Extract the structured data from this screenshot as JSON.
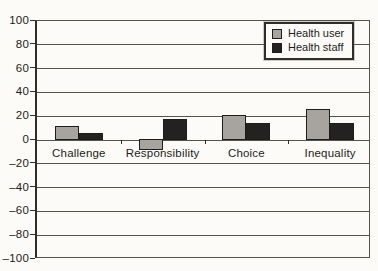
{
  "chart_data": {
    "type": "bar",
    "title": "",
    "categories": [
      "Challenge",
      "Responsibility",
      "Choice",
      "Inequality"
    ],
    "series": [
      {
        "name": "Health user",
        "color": "#a7a4a0",
        "values": [
          12,
          -8,
          21,
          26
        ]
      },
      {
        "name": "Health staff",
        "color": "#232220",
        "values": [
          6,
          18,
          14,
          14
        ]
      }
    ],
    "xlabel": "",
    "ylabel": "",
    "ylim": [
      -100,
      100
    ],
    "ytick_step": 20,
    "ytick_labels": [
      "100",
      "80",
      "60",
      "40",
      "20",
      "0",
      "–20",
      "–40",
      "–60",
      "–80",
      "–100"
    ],
    "grid": true,
    "legend_position": "top-right"
  },
  "colors": {
    "paper": "#fcfbf8",
    "gridline": "#55534e",
    "axis": "#2f2e2a",
    "bar_border": "#1e1d1b",
    "text": "#1c1b19"
  }
}
